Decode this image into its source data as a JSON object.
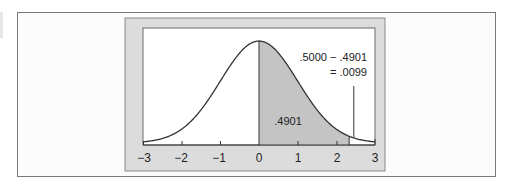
{
  "chart_data": {
    "type": "area",
    "title": "",
    "subtitle": "",
    "xlabel": "",
    "ylabel": "",
    "distribution": "standard normal",
    "x_ticks": [
      -3,
      -2,
      -1,
      0,
      1,
      2,
      3
    ],
    "x_tick_labels": [
      "−3",
      "−2",
      "−1",
      "0",
      "1",
      "2",
      "3"
    ],
    "xlim": [
      -3,
      3
    ],
    "grid": false,
    "legend": null,
    "shaded_region": {
      "from_z": 0,
      "to_z": 2.33,
      "area": 0.4901,
      "label": ".4901"
    },
    "tail_region": {
      "from_z": 2.33,
      "to_z": 3,
      "area": 0.0099
    },
    "annotations": [
      {
        "text": ".5000 − .4901",
        "points_to_z": 2.45
      },
      {
        "text": "= .0099",
        "points_to_z": 2.45
      }
    ]
  },
  "labels": {
    "shaded_area": ".4901",
    "annotation_line1": ".5000 − .4901",
    "annotation_line2": "= .0099",
    "ticks": [
      "−3",
      "−2",
      "−1",
      "0",
      "1",
      "2",
      "3"
    ]
  },
  "colors": {
    "panel_gray": "#dcdcdc",
    "shade_gray": "#c4c4c4",
    "curve": "#333333",
    "frame_border": "#7a7a7a"
  }
}
